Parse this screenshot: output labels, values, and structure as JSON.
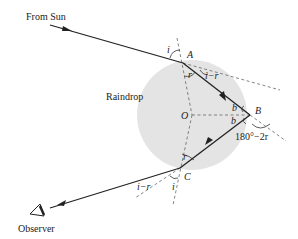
{
  "diagram": {
    "labels": {
      "from_sun": "From Sun",
      "raindrop": "Raindrop",
      "observer": "Observer",
      "point_a": "A",
      "point_b": "B",
      "point_c": "C",
      "center_o": "O",
      "angle_i_at_a": "i",
      "angle_r_at_a": "r",
      "deviation_at_a": "i−r",
      "angle_b_upper": "b",
      "angle_b_lower": "b",
      "deviation_at_b": "180°−2r",
      "angle_r_at_c": "r",
      "angle_i_at_c": "i",
      "deviation_at_c": "i−r"
    },
    "colors": {
      "raindrop_fill": "#e6e6e6",
      "ray": "#222222",
      "dashed": "#555555"
    }
  }
}
